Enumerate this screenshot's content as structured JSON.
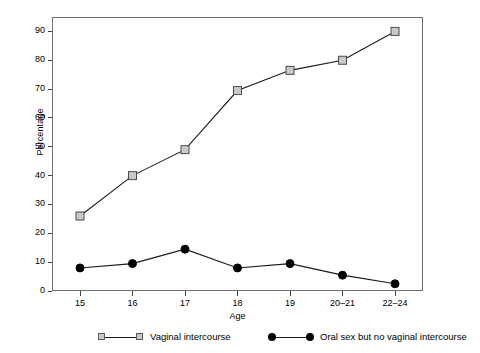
{
  "chart_data": {
    "type": "line",
    "title": "",
    "subtitle": "",
    "xlabel": "Age",
    "ylabel": "Percentage",
    "categories": [
      "15",
      "16",
      "17",
      "18",
      "19",
      "20–21",
      "22–24"
    ],
    "x_tick_labels": [
      "15",
      "16",
      "17",
      "18",
      "19",
      "20–21",
      "22–24"
    ],
    "y_tick_labels": [
      "0",
      "10",
      "20",
      "30",
      "40",
      "50",
      "60",
      "70",
      "80",
      "90"
    ],
    "y_ticks": [
      0,
      10,
      20,
      30,
      40,
      50,
      60,
      70,
      80,
      90
    ],
    "ylim": [
      0,
      95
    ],
    "grid": false,
    "legend_position": "bottom",
    "series": [
      {
        "name": "Vaginal intercourse",
        "marker": "square",
        "marker_fill": "#c9c9c9",
        "marker_edge": "#4a4a4a",
        "line_color": "#1a1a1a",
        "values": [
          26,
          40,
          49,
          69.5,
          76.5,
          80,
          90
        ]
      },
      {
        "name": "Oral sex but no vaginal intercourse",
        "marker": "circle",
        "marker_fill": "#000000",
        "marker_edge": "#000000",
        "line_color": "#1a1a1a",
        "values": [
          8,
          9.5,
          14.5,
          8,
          9.5,
          5.5,
          2.5
        ]
      }
    ],
    "annotations": []
  },
  "axes": {
    "y_title": "Percentage",
    "x_title": "Age"
  },
  "legend": {
    "entries": [
      {
        "label": "Vaginal intercourse",
        "marker": "square"
      },
      {
        "label": "Oral sex but no vaginal intercourse",
        "marker": "circle"
      }
    ]
  },
  "colors": {
    "frame": "#6e6e6e",
    "line": "#1a1a1a",
    "square_fill": "#c9c9c9",
    "square_edge": "#4a4a4a",
    "circle_fill": "#000000",
    "background": "#ffffff",
    "text": "#000000"
  }
}
